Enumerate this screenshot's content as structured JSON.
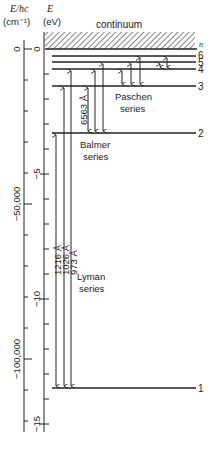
{
  "axes": {
    "left": {
      "label_line1": "E/hc",
      "label_line2": "(cm⁻¹)",
      "ticks": [
        {
          "label": "0",
          "y": 49
        },
        {
          "label": "−50,000",
          "y": 204
        },
        {
          "label": "−100,000",
          "y": 359
        }
      ]
    },
    "right": {
      "label_line1": "E",
      "label_line2": "(eV)",
      "ticks": [
        {
          "label": "0",
          "y": 49
        },
        {
          "label": "−5",
          "y": 174
        },
        {
          "label": "−10",
          "y": 299
        },
        {
          "label": "−15",
          "y": 424
        }
      ]
    }
  },
  "continuum_label": "continuum",
  "n_label": "n",
  "levels": [
    {
      "n": "1",
      "y": 388,
      "energy_eV": -13.6
    },
    {
      "n": "2",
      "y": 133,
      "energy_eV": -3.4
    },
    {
      "n": "3",
      "y": 86,
      "energy_eV": -1.51
    },
    {
      "n": "4",
      "y": 69,
      "energy_eV": -0.85
    },
    {
      "n": "5",
      "y": 62,
      "energy_eV": -0.54
    },
    {
      "n": "6",
      "y": 56,
      "energy_eV": -0.38
    }
  ],
  "series": [
    {
      "name_line1": "Lyman",
      "name_line2": "series",
      "wavelengths": [
        "1216 Å",
        "1026 Å",
        "973 Å"
      ]
    },
    {
      "name_line1": "Balmer",
      "name_line2": "series",
      "wavelengths": [
        "6563 Å"
      ]
    },
    {
      "name_line1": "Paschen",
      "name_line2": "series",
      "wavelengths": []
    }
  ]
}
